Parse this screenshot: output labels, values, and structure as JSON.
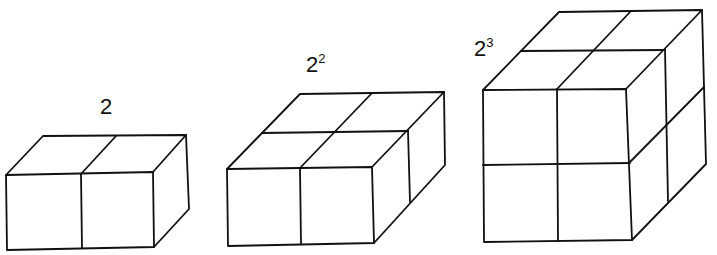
{
  "figure": {
    "colors": {
      "line": "#111111",
      "background": "#ffffff"
    },
    "cubes": [
      {
        "id": "cube-2",
        "label_base": "2",
        "label_exponent": "",
        "units": 2
      },
      {
        "id": "cube-2-squared",
        "label_base": "2",
        "label_exponent": "2",
        "units": 4
      },
      {
        "id": "cube-2-cubed",
        "label_base": "2",
        "label_exponent": "3",
        "units": 8
      }
    ]
  }
}
